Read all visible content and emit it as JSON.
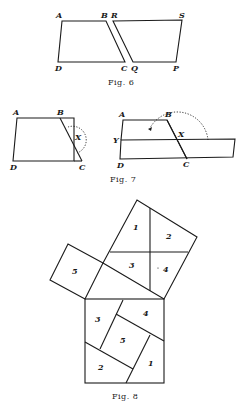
{
  "figures": {
    "fig6": {
      "caption": "Fig. 6",
      "points": {
        "A": "A",
        "B": "B",
        "R": "R",
        "S": "S",
        "D": "D",
        "C": "C",
        "Q": "Q",
        "P": "P"
      }
    },
    "fig7": {
      "caption": "Fig. 7",
      "left": {
        "A": "A",
        "B": "B",
        "X": "X",
        "D": "D",
        "C": "C"
      },
      "right": {
        "A": "A",
        "B": "B",
        "X": "X",
        "Y": "Y",
        "D": "D",
        "C": "C"
      }
    },
    "fig8": {
      "caption": "Fig. 8",
      "top_square": {
        "p1": "1",
        "p2": "2",
        "p3": "3",
        "p4": "4"
      },
      "small_square": {
        "p5": "5"
      },
      "bottom_square": {
        "p1": "1",
        "p2": "2",
        "p3": "3",
        "p4": "4",
        "p5": "5"
      }
    }
  }
}
